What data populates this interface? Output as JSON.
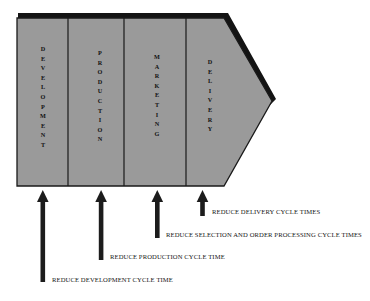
{
  "diagram": {
    "shape": {
      "name": "arrow-banner",
      "fill_color": "#9a9a9a",
      "outline_color": "#1a1a1a",
      "shadow_color": "#141414"
    },
    "stages": [
      {
        "id": "development",
        "label": "DEVELOPMENT",
        "letters": [
          "D",
          "E",
          "V",
          "E",
          "L",
          "O",
          "P",
          "M",
          "E",
          "N",
          "T"
        ]
      },
      {
        "id": "production",
        "label": "PRODUCTION",
        "letters": [
          "P",
          "R",
          "O",
          "D",
          "U",
          "C",
          "T",
          "I",
          "O",
          "N"
        ]
      },
      {
        "id": "marketing",
        "label": "MARKETING",
        "letters": [
          "M",
          "A",
          "R",
          "K",
          "E",
          "T",
          "I",
          "N",
          "G"
        ]
      },
      {
        "id": "delivery",
        "label": "DELIVERY",
        "letters": [
          "D",
          "E",
          "L",
          "I",
          "V",
          "E",
          "R",
          "Y"
        ]
      }
    ],
    "arrows": [
      {
        "id": "arrow-development",
        "target_stage": "development",
        "color": "#1c1c1c"
      },
      {
        "id": "arrow-production",
        "target_stage": "production",
        "color": "#1c1c1c"
      },
      {
        "id": "arrow-marketing",
        "target_stage": "marketing",
        "color": "#1c1c1c"
      },
      {
        "id": "arrow-delivery",
        "target_stage": "delivery",
        "color": "#1c1c1c"
      }
    ],
    "captions": [
      {
        "id": "caption-delivery",
        "text": "REDUCE DELIVERY CYCLE TIMES"
      },
      {
        "id": "caption-selection",
        "text": "REDUCE SELECTION AND ORDER PROCESSING CYCLE TIMES"
      },
      {
        "id": "caption-production",
        "text": "REDUCE PRODUCTION CYCLE TIME"
      },
      {
        "id": "caption-development",
        "text": "REDUCE DEVELOPMENT CYCLE TIME"
      }
    ]
  }
}
